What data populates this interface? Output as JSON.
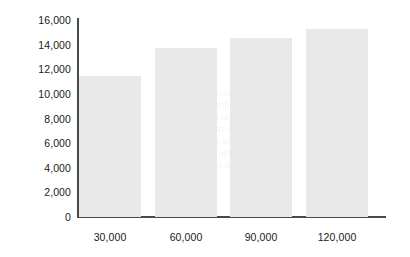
{
  "chart_data": {
    "type": "bar",
    "title": "",
    "subtitle": "",
    "xlabel": "",
    "ylabel": "",
    "categories": [
      "30,000",
      "60,000",
      "90,000",
      "120,000"
    ],
    "values": [
      11300,
      13600,
      14400,
      15100
    ],
    "series": [
      {
        "name": "",
        "values": [
          11300,
          13600,
          14400,
          15100
        ]
      }
    ],
    "ylim": [
      0,
      16000
    ],
    "y_ticks": [
      0,
      2000,
      4000,
      6000,
      8000,
      10000,
      12000,
      14000,
      16000
    ],
    "y_tick_labels": [
      "0",
      "2,000",
      "4,000",
      "6,000",
      "8,000",
      "10,000",
      "12,000",
      "14,000",
      "16,000"
    ],
    "x_tick_labels": [
      "30,000",
      "60,000",
      "90,000",
      "120,000"
    ],
    "grid": false,
    "legend": false,
    "legend_position": "none",
    "bar_color": "#e9e9e9",
    "axis_color": "#4a4a4a",
    "text_color": "#1a1a1a",
    "background_color": "#ffffff",
    "annotations": []
  },
  "axis": {
    "y_labels": [
      {
        "text": "16,000",
        "value": 16000
      },
      {
        "text": "14,000",
        "value": 14000
      },
      {
        "text": "12,000",
        "value": 12000
      },
      {
        "text": "10,000",
        "value": 10000
      },
      {
        "text": "8,000",
        "value": 8000
      },
      {
        "text": "6,000",
        "value": 6000
      },
      {
        "text": "4,000",
        "value": 4000
      },
      {
        "text": "2,000",
        "value": 2000
      },
      {
        "text": "0",
        "value": 0
      }
    ],
    "x_labels": [
      {
        "text": "30,000"
      },
      {
        "text": "60,000"
      },
      {
        "text": "90,000"
      },
      {
        "text": "120,000"
      }
    ]
  },
  "ghost_text": {
    "lines": [
      "the population of a region",
      "and the number of units",
      "sold in that region",
      "increases as shown",
      "in the chart above",
      "values are approximate",
      "see note for detail"
    ]
  }
}
